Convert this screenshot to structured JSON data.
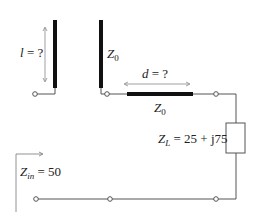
{
  "diagram": {
    "stub": {
      "length_label": "l = ?",
      "length_var": "l",
      "length_rest": " = ?",
      "impedance_var": "Z",
      "impedance_sub": "0"
    },
    "line": {
      "distance_var": "d",
      "distance_rest": " = ?",
      "impedance_var": "Z",
      "impedance_sub": "0"
    },
    "load": {
      "var": "Z",
      "sub": "L",
      "value": " = 25 + j75"
    },
    "input": {
      "var": "Z",
      "sub": "in",
      "value": " = 50"
    },
    "colors": {
      "line": "#555555",
      "thick_line": "#111111",
      "text": "#222222",
      "arrow": "#888888"
    }
  }
}
